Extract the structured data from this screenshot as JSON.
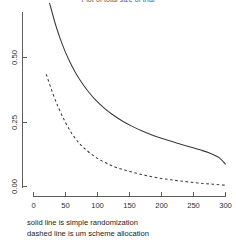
{
  "title": "Plot of total size of trial",
  "caption": {
    "line1": "solid  line is simple randomization",
    "line2": "dashed line is um scheme allocation"
  },
  "chart_data": {
    "type": "line",
    "title": "Plot of total size of trial",
    "xlabel": "",
    "ylabel": "",
    "xlim": [
      0,
      300
    ],
    "ylim": [
      0.0,
      0.75
    ],
    "grid": false,
    "legend_position": "below-plot-as-caption",
    "xticks": [
      0,
      50,
      100,
      150,
      200,
      250,
      300
    ],
    "xticklabels": [
      "0",
      "50",
      "100",
      "150",
      "200",
      "250",
      "300"
    ],
    "yticks": [
      0.0,
      0.25,
      0.5
    ],
    "yticklabels": [
      "0.00",
      "0.25",
      "0.50"
    ],
    "series": [
      {
        "name": "solid  line is simple randomization",
        "style": "solid",
        "color": "#3a3a3a",
        "x": [
          25,
          35,
          45,
          55,
          65,
          75,
          85,
          95,
          110,
          125,
          140,
          155,
          170,
          185,
          200,
          215,
          230,
          245,
          260,
          275,
          290,
          300
        ],
        "y": [
          0.712,
          0.623,
          0.551,
          0.492,
          0.444,
          0.404,
          0.37,
          0.341,
          0.305,
          0.276,
          0.252,
          0.232,
          0.215,
          0.2,
          0.187,
          0.175,
          0.164,
          0.153,
          0.142,
          0.13,
          0.112,
          0.086
        ]
      },
      {
        "name": "dashed line is um scheme allocation",
        "style": "dashed",
        "color": "#3a3a3a",
        "x": [
          20,
          30,
          40,
          50,
          60,
          70,
          80,
          95,
          110,
          125,
          140,
          155,
          170,
          185,
          200,
          215,
          230,
          245,
          260,
          275,
          290,
          300
        ],
        "y": [
          0.435,
          0.362,
          0.3,
          0.248,
          0.205,
          0.172,
          0.147,
          0.117,
          0.095,
          0.078,
          0.065,
          0.055,
          0.046,
          0.038,
          0.031,
          0.026,
          0.021,
          0.017,
          0.013,
          0.01,
          0.007,
          0.005
        ]
      }
    ]
  }
}
